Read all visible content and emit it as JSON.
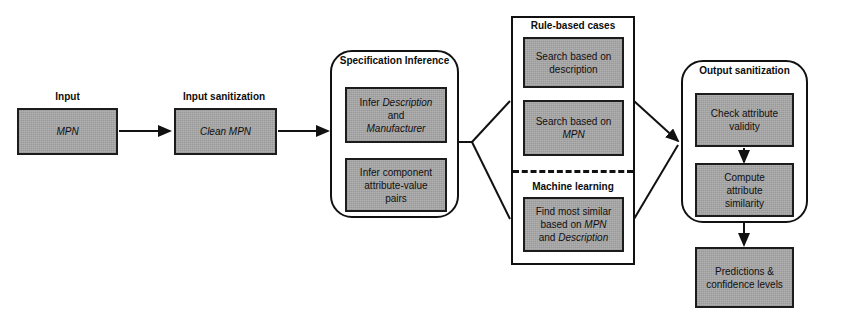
{
  "diagram": {
    "colors": {
      "box_fill": "#a9a9a9",
      "box_stroke": "#1c1c1c",
      "group_stroke": "#111111",
      "connector": "#111111",
      "background": "#ffffff"
    }
  },
  "stages": {
    "input": {
      "caption": "Input",
      "box": {
        "text": "MPN",
        "italic": true
      }
    },
    "input_sanitization": {
      "caption": "Input sanitization",
      "box": {
        "text": "Clean MPN",
        "italic": true
      }
    },
    "specification_inference": {
      "title": "Specification Inference",
      "boxes": [
        {
          "lines": [
            {
              "text": "Infer ",
              "italic": false
            },
            {
              "text": "Description",
              "italic": true
            },
            {
              "text": "and",
              "italic": false
            },
            {
              "text": "Manufacturer",
              "italic": true
            }
          ],
          "plain": "Infer Description and Manufacturer"
        },
        {
          "lines": [
            {
              "text": "Infer component",
              "italic": false
            },
            {
              "text": "attribute-value",
              "italic": false
            },
            {
              "text": "pairs",
              "italic": false
            }
          ],
          "plain": "Infer component attribute-value pairs"
        }
      ]
    },
    "matching": {
      "rule_based": {
        "title": "Rule-based cases",
        "boxes": [
          {
            "lines": [
              {
                "text": "Search based on",
                "italic": false
              },
              {
                "text": "description",
                "italic": false
              }
            ],
            "plain": "Search based on description"
          },
          {
            "lines": [
              {
                "text": "Search based on",
                "italic": false
              },
              {
                "text": "MPN",
                "italic": true
              }
            ],
            "plain": "Search based on MPN"
          }
        ]
      },
      "machine_learning": {
        "title": "Machine learning",
        "boxes": [
          {
            "lines": [
              {
                "text": "Find most similar",
                "italic": false
              },
              {
                "text": "based on MPN",
                "italic": false
              },
              {
                "text": "and Description",
                "italic": false
              }
            ],
            "plain": "Find most similar based on MPN and Description"
          }
        ]
      }
    },
    "output_sanitization": {
      "title": "Output sanitization",
      "boxes": [
        {
          "lines": [
            {
              "text": "Check attribute",
              "italic": false
            },
            {
              "text": "validity",
              "italic": false
            }
          ],
          "plain": "Check attribute validity"
        },
        {
          "lines": [
            {
              "text": "Compute",
              "italic": false
            },
            {
              "text": "attribute",
              "italic": false
            },
            {
              "text": "similarity",
              "italic": false
            }
          ],
          "plain": "Compute attribute similarity"
        }
      ]
    },
    "result": {
      "box": {
        "lines": [
          {
            "text": "Predictions &",
            "italic": false
          },
          {
            "text": "confidence levels",
            "italic": false
          }
        ],
        "plain": "Predictions & confidence levels"
      }
    }
  }
}
